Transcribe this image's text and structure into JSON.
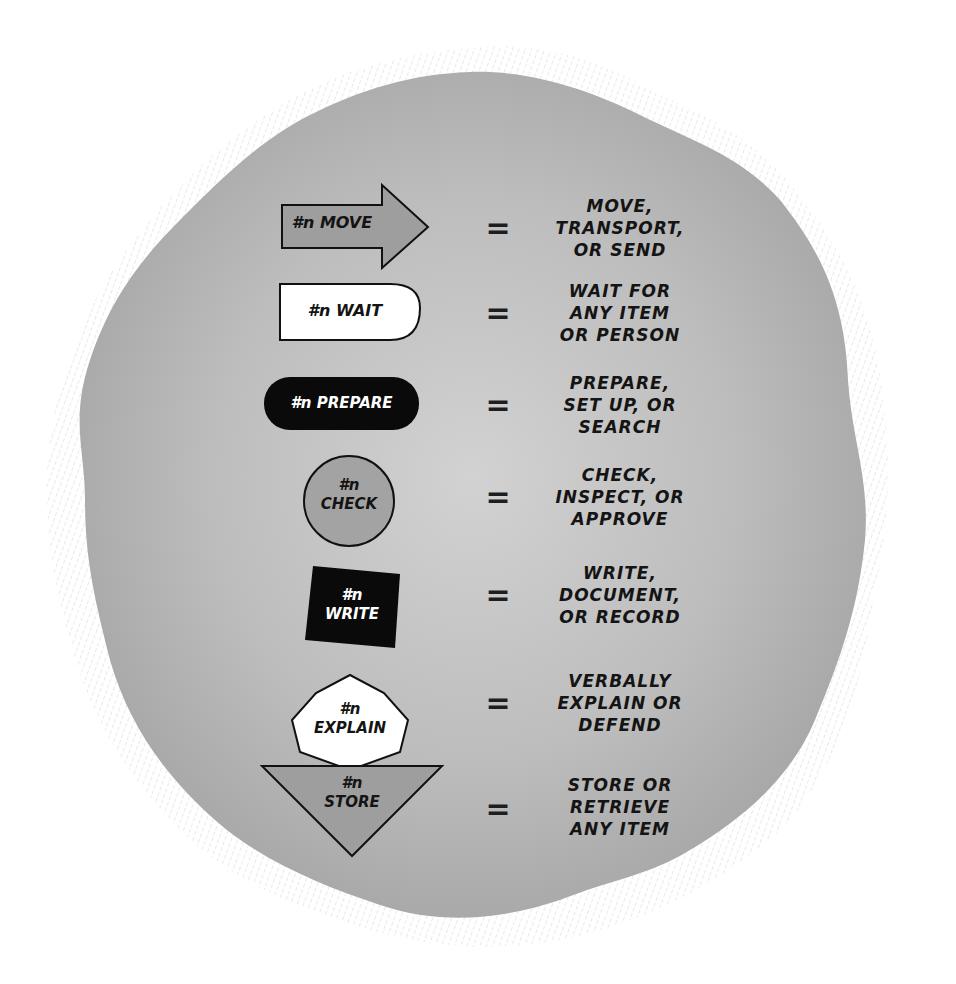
{
  "diagram": {
    "title": "",
    "background_blob_color": "#b9b9b9",
    "rows": [
      {
        "symbol": "arrow",
        "symbol_fill": "#9e9e9e",
        "label_line1": "#n MOVE",
        "label_line2": "",
        "equals": "=",
        "meaning": [
          "MOVE,",
          "TRANSPORT,",
          "OR SEND"
        ]
      },
      {
        "symbol": "delay-d-shape",
        "symbol_fill": "#ffffff",
        "label_line1": "#n WAIT",
        "label_line2": "",
        "equals": "=",
        "meaning": [
          "WAIT FOR",
          "ANY ITEM",
          "OR PERSON"
        ]
      },
      {
        "symbol": "rounded-pill",
        "symbol_fill": "#0a0a0a",
        "label_line1": "#n PREPARE",
        "label_line2": "",
        "equals": "=",
        "meaning": [
          "PREPARE,",
          "SET UP, OR",
          "SEARCH"
        ]
      },
      {
        "symbol": "circle",
        "symbol_fill": "#a3a3a3",
        "label_line1": "#n",
        "label_line2": "CHECK",
        "equals": "=",
        "meaning": [
          "CHECK,",
          "INSPECT, OR",
          "APPROVE"
        ]
      },
      {
        "symbol": "tilted-square",
        "symbol_fill": "#0a0a0a",
        "label_line1": "#n",
        "label_line2": "WRITE",
        "equals": "=",
        "meaning": [
          "WRITE,",
          "DOCUMENT,",
          "OR RECORD"
        ]
      },
      {
        "symbol": "heptagon",
        "symbol_fill": "#ffffff",
        "label_line1": "#n",
        "label_line2": "EXPLAIN",
        "equals": "=",
        "meaning": [
          "VERBALLY",
          "EXPLAIN OR",
          "DEFEND"
        ]
      },
      {
        "symbol": "inverted-triangle",
        "symbol_fill": "#9e9e9e",
        "label_line1": "#n",
        "label_line2": "STORE",
        "equals": "=",
        "meaning": [
          "STORE OR",
          "RETRIEVE",
          "ANY ITEM"
        ]
      }
    ]
  }
}
